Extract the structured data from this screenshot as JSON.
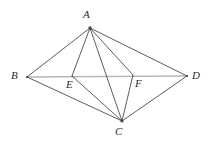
{
  "figure": {
    "kind": "geometry-diagram",
    "canvas": {
      "width": 215,
      "height": 146,
      "background": "#ffffff"
    },
    "style": {
      "stroke_color": "#4a4a52",
      "stroke_width": 0.9,
      "diagonal_color": "#b7b7bc",
      "diagonal_width": 1.5,
      "label_color": "#2b2b2b",
      "label_font_size": 11
    },
    "points": [
      {
        "id": "A",
        "label": "A",
        "x": 90,
        "y": 28,
        "label_x": 83,
        "label_y": 9
      },
      {
        "id": "B",
        "label": "B",
        "x": 27,
        "y": 77,
        "label_x": 11,
        "label_y": 70
      },
      {
        "id": "C",
        "label": "C",
        "x": 122,
        "y": 121,
        "label_x": 115,
        "label_y": 126
      },
      {
        "id": "D",
        "label": "D",
        "x": 187,
        "y": 76,
        "label_x": 192,
        "label_y": 70
      },
      {
        "id": "E",
        "label": "E",
        "x": 72,
        "y": 76,
        "label_x": 66,
        "label_y": 79
      },
      {
        "id": "F",
        "label": "F",
        "x": 133,
        "y": 75,
        "label_x": 135,
        "label_y": 78
      }
    ],
    "segments": [
      {
        "id": "BD",
        "from": "B",
        "to": "D",
        "role": "diagonal"
      },
      {
        "id": "AB",
        "from": "A",
        "to": "B",
        "role": "side"
      },
      {
        "id": "AD",
        "from": "A",
        "to": "D",
        "role": "side"
      },
      {
        "id": "CB",
        "from": "C",
        "to": "B",
        "role": "side"
      },
      {
        "id": "CD",
        "from": "C",
        "to": "D",
        "role": "side"
      },
      {
        "id": "AE",
        "from": "A",
        "to": "E",
        "role": "cevian"
      },
      {
        "id": "AF",
        "from": "A",
        "to": "F",
        "role": "cevian"
      },
      {
        "id": "AC",
        "from": "A",
        "to": "C",
        "role": "diagonal"
      },
      {
        "id": "CE",
        "from": "C",
        "to": "E",
        "role": "cevian"
      },
      {
        "id": "CF",
        "from": "C",
        "to": "F",
        "role": "cevian"
      }
    ]
  }
}
